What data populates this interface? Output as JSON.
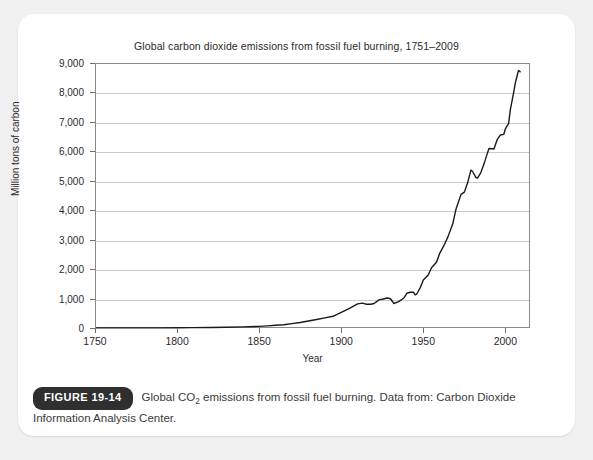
{
  "figure": {
    "badge_label": "FIGURE 19-14",
    "caption_part1": "Global CO",
    "caption_sub": "2",
    "caption_part2": " emissions from fossil fuel burning. Data from: Carbon Dioxide Information Analysis Center."
  },
  "colors": {
    "page_background": "#f0f0f0",
    "card_background": "#ffffff",
    "plot_line": "#1a1a1a",
    "gridline": "#c9c9c9",
    "axis": "#8a8a8a",
    "badge_background": "#2f2f2f",
    "text": "#2b2b2b"
  },
  "chart_data": {
    "type": "line",
    "title": "Global carbon dioxide emissions from fossil fuel burning, 1751–2009",
    "xlabel": "Year",
    "ylabel": "Million tons of carbon",
    "xlim": [
      1750,
      2015
    ],
    "ylim": [
      0,
      9000
    ],
    "grid": true,
    "legend": "none",
    "xticks": [
      1750,
      1800,
      1850,
      1900,
      1950,
      2000
    ],
    "xtick_labels": [
      "1750",
      "1800",
      "1850",
      "1900",
      "1950",
      "2000"
    ],
    "yticks": [
      0,
      1000,
      2000,
      3000,
      4000,
      5000,
      6000,
      7000,
      8000,
      9000
    ],
    "ytick_labels": [
      "0",
      "1,000",
      "2,000",
      "3,000",
      "4,000",
      "5,000",
      "6,000",
      "7,000",
      "8,000",
      "9,000"
    ],
    "series": [
      {
        "name": "Global CO2 emissions from fossil fuel burning",
        "units": "Million tons of carbon",
        "x": [
          1751,
          1760,
          1770,
          1780,
          1790,
          1800,
          1810,
          1820,
          1830,
          1840,
          1850,
          1855,
          1860,
          1865,
          1870,
          1875,
          1880,
          1885,
          1890,
          1895,
          1900,
          1905,
          1910,
          1913,
          1915,
          1918,
          1920,
          1923,
          1925,
          1928,
          1930,
          1932,
          1935,
          1938,
          1940,
          1942,
          1944,
          1945,
          1946,
          1948,
          1950,
          1953,
          1955,
          1958,
          1960,
          1963,
          1965,
          1968,
          1970,
          1973,
          1975,
          1977,
          1979,
          1980,
          1982,
          1983,
          1985,
          1987,
          1989,
          1990,
          1992,
          1993,
          1995,
          1997,
          1999,
          2000,
          2002,
          2003,
          2005,
          2006,
          2007,
          2008,
          2009
        ],
        "y": [
          3,
          3,
          3,
          3,
          3,
          8,
          13,
          18,
          24,
          38,
          54,
          72,
          91,
          109,
          147,
          187,
          236,
          287,
          344,
          398,
          534,
          664,
          819,
          843,
          809,
          807,
          830,
          955,
          975,
          1020,
          994,
          833,
          895,
          1009,
          1180,
          1215,
          1216,
          1126,
          1154,
          1352,
          1630,
          1800,
          2044,
          2230,
          2535,
          2850,
          3095,
          3550,
          4053,
          4538,
          4615,
          4930,
          5361,
          5315,
          5113,
          5094,
          5271,
          5575,
          5931,
          6097,
          6087,
          6081,
          6395,
          6556,
          6574,
          6765,
          6951,
          7405,
          7987,
          8308,
          8532,
          8749,
          8700
        ]
      }
    ],
    "annotations": []
  }
}
